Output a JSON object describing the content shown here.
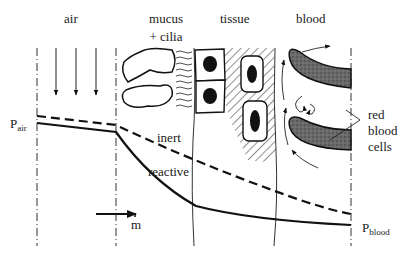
{
  "regions": [
    {
      "id": "air",
      "label": "air"
    },
    {
      "id": "mucus",
      "label_line1": "mucus",
      "label_line2": "+ cilia"
    },
    {
      "id": "tissue",
      "label": "tissue"
    },
    {
      "id": "blood",
      "label": "blood"
    }
  ],
  "curves": {
    "inert": "inert",
    "reactive": "reactive"
  },
  "pressure_labels": {
    "p_air_main": "P",
    "p_air_sub": "air",
    "p_blood_main": "P",
    "p_blood_sub": "blood"
  },
  "flux_label": "m",
  "rbc_label_line1": "red",
  "rbc_label_line2": "blood",
  "rbc_label_line3": "cells",
  "colors": {
    "line": "#111111",
    "rbc_fill": "#5a5a5a",
    "background": "#ffffff"
  }
}
